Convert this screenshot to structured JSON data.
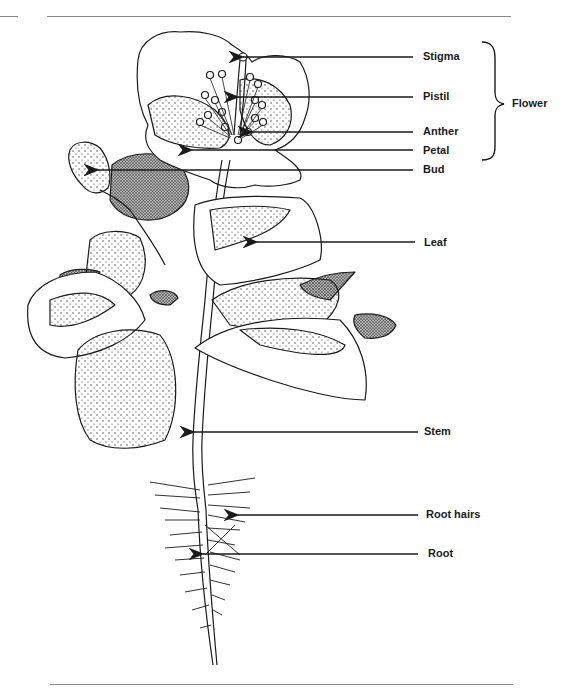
{
  "diagram": {
    "labels": [
      {
        "id": "stigma",
        "text": "Stigma",
        "x": 423,
        "y": 50,
        "arrow_from": 413,
        "arrow_to": 243,
        "arrow_y": 57
      },
      {
        "id": "pistil",
        "text": "Pistil",
        "x": 423,
        "y": 90,
        "arrow_from": 413,
        "arrow_to": 238,
        "arrow_y": 97
      },
      {
        "id": "anther",
        "text": "Anther",
        "x": 423,
        "y": 125,
        "arrow_from": 413,
        "arrow_to": 252,
        "arrow_y": 132
      },
      {
        "id": "petal",
        "text": "Petal",
        "x": 423,
        "y": 144,
        "arrow_from": 413,
        "arrow_to": 192,
        "arrow_y": 150
      },
      {
        "id": "bud",
        "text": "Bud",
        "x": 423,
        "y": 163,
        "arrow_from": 413,
        "arrow_to": 98,
        "arrow_y": 170
      },
      {
        "id": "leaf",
        "text": "Leaf",
        "x": 424,
        "y": 236,
        "arrow_from": 415,
        "arrow_to": 257,
        "arrow_y": 242
      },
      {
        "id": "stem",
        "text": "Stem",
        "x": 424,
        "y": 425,
        "arrow_from": 418,
        "arrow_to": 194,
        "arrow_y": 432
      },
      {
        "id": "root-hairs",
        "text": "Root hairs",
        "x": 426,
        "y": 508,
        "arrow_from": 418,
        "arrow_to": 238,
        "arrow_y": 515
      },
      {
        "id": "root",
        "text": "Root",
        "x": 428,
        "y": 547,
        "arrow_from": 418,
        "arrow_to": 203,
        "arrow_y": 554
      }
    ],
    "group": {
      "text": "Flower",
      "x": 512,
      "y": 97,
      "brace_top": 42,
      "brace_bottom": 160
    }
  },
  "colors": {
    "ink": "#1a1a1a",
    "rule": "#8a8a8a",
    "background": "#ffffff"
  }
}
